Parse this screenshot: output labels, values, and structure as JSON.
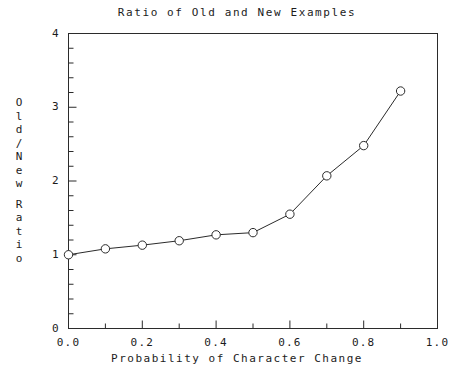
{
  "chart_data": {
    "type": "line",
    "title": "Ratio of Old and New Examples",
    "xlabel": "Probability of Character Change",
    "ylabel": "Old/New Ratio",
    "x": [
      0.0,
      0.1,
      0.2,
      0.3,
      0.4,
      0.5,
      0.6,
      0.7,
      0.8,
      0.9
    ],
    "values": [
      1.0,
      1.08,
      1.13,
      1.19,
      1.27,
      1.3,
      1.55,
      2.07,
      2.48,
      3.22
    ],
    "series": [
      {
        "name": "Old/New Ratio",
        "values": [
          1.0,
          1.08,
          1.13,
          1.19,
          1.27,
          1.3,
          1.55,
          2.07,
          2.48,
          3.22
        ]
      }
    ],
    "xlim": [
      0.0,
      1.0
    ],
    "ylim": [
      0,
      4
    ],
    "xticks": [
      0.0,
      0.2,
      0.4,
      0.6,
      0.8,
      1.0
    ],
    "xtick_labels": [
      "0.0",
      "0.2",
      "0.4",
      "0.6",
      "0.8",
      "1.0"
    ],
    "xminor_step": 0.1,
    "yticks": [
      0,
      1,
      2,
      3,
      4
    ],
    "ytick_labels": [
      "0",
      "1",
      "2",
      "3",
      "4"
    ],
    "yminor_step": 0.2,
    "grid": false,
    "legend": "none",
    "marker": "open-circle",
    "line_color": "#2b2b2b",
    "marker_fill": "#ffffff",
    "axis_color": "#2b2b2b",
    "background": "#ffffff"
  },
  "ylabel_chars": [
    "O",
    "l",
    "d",
    "/",
    "N",
    "e",
    "w",
    "",
    "R",
    "a",
    "t",
    "i",
    "o"
  ]
}
